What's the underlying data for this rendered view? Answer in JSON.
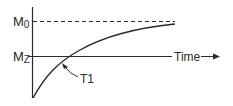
{
  "diagram": {
    "type": "T1 recovery curve",
    "labels": {
      "m0_main": "M",
      "m0_sub": "0",
      "mz_main": "M",
      "mz_sub": "Z",
      "time": "Time",
      "t1": "T1"
    },
    "colors": {
      "line": "#2a2a2a",
      "background": "#ffffff"
    }
  }
}
